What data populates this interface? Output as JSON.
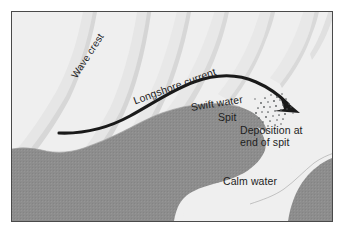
{
  "figure": {
    "frame": {
      "border_color": "#4a4a4a",
      "background_color": "#efefef",
      "page_color": "#ffffff"
    }
  },
  "colors": {
    "land_gray": "#8d8d8d",
    "water_light": "#efefef",
    "wave_ridge": "#dcdcdc",
    "wave_shadow": "#cfcfcf",
    "arrow_black": "#1a1a1a",
    "text_color": "#1d1d1d",
    "stipple_color": "#55585a"
  },
  "labels": {
    "wave_crest": "Wave crest",
    "longshore_current": "Longshore current",
    "swift_water": "Swift water",
    "spit": "Spit",
    "deposition_line1": "Deposition at",
    "deposition_line2": "end of spit",
    "calm_water": "Calm water"
  },
  "icons": {
    "current_arrow": "curved-arrow-right",
    "stipple_cloud": "sediment-stipple-cloud"
  },
  "regions": [
    {
      "name": "open-ocean-wave-field",
      "fill": "#efefef",
      "description": "Light area upper-left with diagonal wave crest ridges"
    },
    {
      "name": "landmass",
      "fill": "#8d8d8d",
      "description": "Gray shoreline mass across lower-left curving up to the right forming the spit"
    },
    {
      "name": "spit",
      "fill": "#8d8d8d",
      "description": "Narrow gray finger of land extending right from the shore"
    },
    {
      "name": "calm-water-bay",
      "fill": "#efefef",
      "description": "Light sheltered water in the lower-right behind the spit"
    }
  ]
}
